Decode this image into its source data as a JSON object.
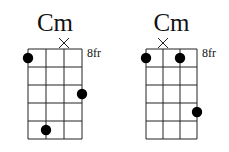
{
  "diagrams": [
    {
      "name": "Cm",
      "fret_label": "8fr",
      "strings": 4,
      "frets": 5,
      "muted_strings": [
        3
      ],
      "dots": [
        {
          "string": 1,
          "fret": 1
        },
        {
          "string": 4,
          "fret": 3
        },
        {
          "string": 2,
          "fret": 5
        }
      ],
      "geom": {
        "x": 28,
        "y": 49,
        "w": 54,
        "h": 90
      }
    },
    {
      "name": "Cm",
      "fret_label": "8fr",
      "strings": 4,
      "frets": 5,
      "muted_strings": [
        2
      ],
      "dots": [
        {
          "string": 1,
          "fret": 1
        },
        {
          "string": 3,
          "fret": 1
        },
        {
          "string": 4,
          "fret": 4
        }
      ],
      "geom": {
        "x": 146,
        "y": 49,
        "w": 51,
        "h": 90
      }
    }
  ],
  "colors": {
    "line": "#222222",
    "dot": "#000000",
    "text": "#111111"
  }
}
